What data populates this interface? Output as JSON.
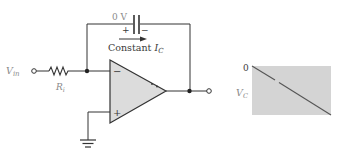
{
  "diagram": {
    "type": "op-amp integrator",
    "labels": {
      "cap_voltage": "0 V",
      "cap_plus": "+",
      "cap_minus": "−",
      "current_label_main": "Constant ",
      "current_label_var": "I",
      "current_label_sub": "C",
      "input_var": "V",
      "input_sub": "in",
      "resistor_var": "R",
      "resistor_sub": "i",
      "opamp_inverting": "−",
      "opamp_noninverting": "+",
      "graph_zero": "0",
      "graph_var": "V",
      "graph_sub": "C"
    },
    "colors": {
      "wire": "#333333",
      "opamp_fill": "#dcdcdc",
      "graph_fill": "#d4d4d4",
      "graph_line": "#555555"
    }
  }
}
